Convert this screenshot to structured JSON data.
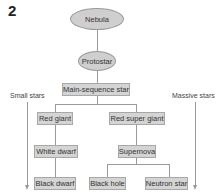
{
  "figure": {
    "number": "2"
  },
  "nodes": {
    "nebula": "Nebula",
    "protostar": "Protostar",
    "main_sequence": "Main-sequence star",
    "red_giant": "Red giant",
    "red_super_giant": "Red super giant",
    "white_dwarf": "White dwarf",
    "supernova": "Supernova",
    "black_dwarf": "Black dwarf",
    "black_hole": "Black hole",
    "neutron_star": "Neutron star"
  },
  "side_labels": {
    "left": "Small stars",
    "right": "Massive stars"
  },
  "edges": [
    [
      "Nebula",
      "Protostar"
    ],
    [
      "Protostar",
      "Main-sequence star"
    ],
    [
      "Main-sequence star",
      "Red giant"
    ],
    [
      "Main-sequence star",
      "Red super giant"
    ],
    [
      "Red giant",
      "White dwarf"
    ],
    [
      "White dwarf",
      "Black dwarf"
    ],
    [
      "Red super giant",
      "Supernova"
    ],
    [
      "Supernova",
      "Black hole"
    ],
    [
      "Supernova",
      "Neutron star"
    ]
  ],
  "colors": {
    "node_fill": "#d4d4d4",
    "node_border": "#a8a8a8",
    "line": "#9a9a9a"
  }
}
